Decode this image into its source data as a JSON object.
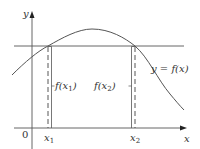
{
  "diagram": {
    "type": "function-graph-horizontal-line-test",
    "colors": {
      "line": "#555555",
      "curve": "#555555",
      "text": "#333333",
      "background": "#ffffff"
    },
    "axes": {
      "x_label": "x",
      "y_label": "y",
      "origin_label": "0"
    },
    "curve_label": "y = f(x)",
    "points": [
      {
        "name": "x1",
        "base": "x",
        "sub": "1",
        "value_label_prefix": "f(x",
        "value_label_sub": "1",
        "value_label_suffix": ")"
      },
      {
        "name": "x2",
        "base": "x",
        "sub": "2",
        "value_label_prefix": "f(x",
        "value_label_sub": "2",
        "value_label_suffix": ")"
      }
    ],
    "horizontal_line": "y = f(x1) = f(x2)"
  }
}
